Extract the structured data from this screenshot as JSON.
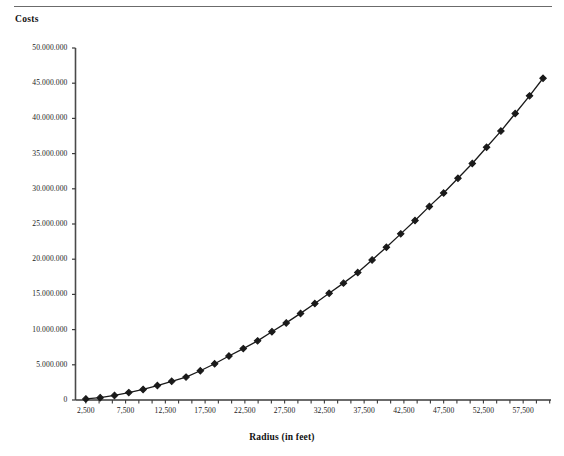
{
  "page": {
    "background_color": "#ffffff",
    "rule_color": "#6b6b6b"
  },
  "chart_data": {
    "type": "line",
    "title": "",
    "xlabel": "Radius (in feet)",
    "ylabel": "Costs",
    "series_color": "#1a1a1a",
    "marker": "diamond",
    "grid": false,
    "legend": "none",
    "xlim": [
      1200,
      61000
    ],
    "ylim": [
      0,
      50000000
    ],
    "xtick_labels": [
      "2,500",
      "7,500",
      "12,500",
      "17,500",
      "22,500",
      "27,500",
      "32,500",
      "37,500",
      "42,500",
      "47,500",
      "52,500",
      "57,500"
    ],
    "xtick_values": [
      2500,
      7500,
      12500,
      17500,
      22500,
      27500,
      32500,
      37500,
      42500,
      47500,
      52500,
      57500
    ],
    "ytick_labels": [
      "0",
      "5.000.000",
      "10.000.000",
      "15.000.000",
      "20.000.000",
      "25.000.000",
      "30.000.000",
      "35.000.000",
      "40.000.000",
      "45.000.000",
      "50.000.000"
    ],
    "ytick_values": [
      0,
      5000000,
      10000000,
      15000000,
      20000000,
      25000000,
      30000000,
      35000000,
      40000000,
      45000000,
      50000000
    ],
    "x": [
      2500,
      4300,
      6100,
      7900,
      9700,
      11500,
      13300,
      15100,
      16900,
      18700,
      20500,
      22300,
      24100,
      25900,
      27700,
      29500,
      31300,
      33100,
      34900,
      36700,
      38500,
      40300,
      42100,
      43900,
      45700,
      47500,
      49300,
      51100,
      52900,
      54700,
      56500,
      58300,
      60000
    ],
    "y": [
      150000,
      330000,
      650000,
      1050000,
      1500000,
      2050000,
      2650000,
      3250000,
      4150000,
      5150000,
      6250000,
      7300000,
      8400000,
      9700000,
      10950000,
      12300000,
      13700000,
      15150000,
      16600000,
      18100000,
      19900000,
      21700000,
      23600000,
      25500000,
      27500000,
      29400000,
      31500000,
      33600000,
      35900000,
      38200000,
      40700000,
      43200000,
      45700000
    ]
  }
}
